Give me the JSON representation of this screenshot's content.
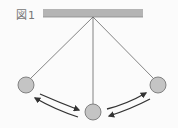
{
  "figure": {
    "label": "図1",
    "colors": {
      "ceiling": "#b4b4b4",
      "string": "#666666",
      "bob_fill": "#c4c4c4",
      "bob_stroke": "#777777",
      "arrow": "#333333",
      "label": "#777777"
    },
    "positions": [
      "left",
      "center",
      "right"
    ]
  }
}
